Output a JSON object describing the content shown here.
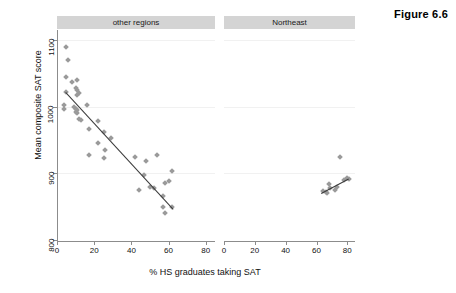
{
  "figure": {
    "label": "Figure 6.6"
  },
  "axes": {
    "xlabel": "% HS graduates taking SAT",
    "ylabel": "Mean composite SAT score",
    "yticks": [
      "800",
      "900",
      "1000",
      "1100"
    ],
    "xticks": [
      "0",
      "20",
      "40",
      "60",
      "80"
    ]
  },
  "panels": [
    {
      "name": "other-regions",
      "title": "other regions"
    },
    {
      "name": "northeast",
      "title": "Northeast"
    }
  ],
  "chart_data": {
    "type": "scatter",
    "title": "Figure 6.6",
    "xlabel": "% HS graduates taking SAT",
    "ylabel": "Mean composite SAT score",
    "xlim": [
      0,
      85
    ],
    "ylim": [
      800,
      1115
    ],
    "xticks": [
      0,
      20,
      40,
      60,
      80
    ],
    "yticks": [
      800,
      900,
      1000,
      1100
    ],
    "grid": "horizontal-faint",
    "legend": "none",
    "facets": [
      {
        "name": "other regions",
        "points": [
          [
            5,
            1090
          ],
          [
            6,
            1070
          ],
          [
            5,
            1045
          ],
          [
            8,
            1037
          ],
          [
            11,
            1040
          ],
          [
            5,
            1022
          ],
          [
            10,
            1028
          ],
          [
            11,
            1025
          ],
          [
            11,
            1018
          ],
          [
            12,
            1020
          ],
          [
            4,
            1002
          ],
          [
            4,
            996
          ],
          [
            9,
            999
          ],
          [
            10,
            997
          ],
          [
            11,
            995
          ],
          [
            10,
            992
          ],
          [
            11,
            990
          ],
          [
            16,
            1003
          ],
          [
            12,
            982
          ],
          [
            13,
            980
          ],
          [
            22,
            979
          ],
          [
            17,
            967
          ],
          [
            25,
            962
          ],
          [
            22,
            946
          ],
          [
            29,
            953
          ],
          [
            26,
            935
          ],
          [
            17,
            927
          ],
          [
            25,
            923
          ],
          [
            42,
            925
          ],
          [
            48,
            918
          ],
          [
            54,
            927
          ],
          [
            62,
            904
          ],
          [
            47,
            897
          ],
          [
            58,
            886
          ],
          [
            60,
            888
          ],
          [
            44,
            875
          ],
          [
            50,
            880
          ],
          [
            52,
            878
          ],
          [
            57,
            866
          ],
          [
            57,
            849
          ],
          [
            62,
            849
          ],
          [
            58,
            840
          ]
        ],
        "fit_line": {
          "x1": 5,
          "y1": 1022,
          "x2": 63,
          "y2": 846
        }
      },
      {
        "name": "Northeast",
        "points": [
          [
            64,
            874
          ],
          [
            66,
            872
          ],
          [
            67,
            870
          ],
          [
            68,
            884
          ],
          [
            69,
            878
          ],
          [
            72,
            875
          ],
          [
            73,
            880
          ],
          [
            75,
            925
          ],
          [
            78,
            890
          ],
          [
            80,
            893
          ],
          [
            81,
            892
          ]
        ],
        "fit_line": {
          "x1": 63,
          "y1": 871,
          "x2": 81,
          "y2": 893
        }
      }
    ]
  }
}
